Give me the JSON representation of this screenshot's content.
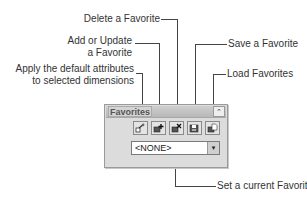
{
  "callouts": {
    "delete": "Delete a Favorite",
    "add_line1": "Add or Update",
    "add_line2": "a Favorite",
    "apply_line1": "Apply the default attributes",
    "apply_line2": "to selected dimensions",
    "save": "Save a Favorite",
    "load": "Load Favorites",
    "set_current": "Set a current Favorite"
  },
  "panel": {
    "title": "Favorites",
    "collapse_glyph": "⌃",
    "buttons": [
      {
        "name": "apply-defaults",
        "icon": "apply-attributes-icon"
      },
      {
        "name": "add-update-favorite",
        "icon": "add-favorite-icon"
      },
      {
        "name": "delete-favorite",
        "icon": "delete-favorite-icon"
      },
      {
        "name": "save-favorite",
        "icon": "save-favorite-icon"
      },
      {
        "name": "load-favorites",
        "icon": "load-favorites-icon"
      }
    ],
    "dropdown": {
      "value": "<NONE>",
      "arrow": "▼"
    }
  }
}
